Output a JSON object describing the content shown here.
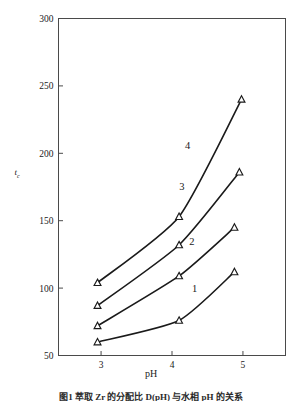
{
  "figure": {
    "caption": "图1  萃取 Zr 的分配比 D(pH) 与水相 pH 的关系"
  },
  "chart_data": {
    "type": "line",
    "title": "",
    "xlabel": "pH",
    "ylabel": "t_c",
    "ylabel_main": "t",
    "ylabel_sub": "c",
    "xlim": [
      2.4,
      5.6
    ],
    "ylim": [
      50,
      300
    ],
    "xticks": [
      3,
      4,
      5
    ],
    "xticklabels": [
      "3",
      "4",
      "5"
    ],
    "yticks": [
      50,
      100,
      150,
      200,
      250,
      300
    ],
    "yticklabels": [
      "50",
      "100",
      "150",
      "200",
      "250",
      "300"
    ],
    "grid": false,
    "legend": "inline-curve-numbers",
    "marker": "open-triangle",
    "line_color": "#1a1a1a",
    "series": [
      {
        "name": "1",
        "label": "1",
        "label_x": 4.32,
        "label_y": 97,
        "x": [
          2.95,
          4.1,
          4.88
        ],
        "y": [
          60,
          76,
          112
        ]
      },
      {
        "name": "2",
        "label": "2",
        "label_x": 4.28,
        "label_y": 132,
        "x": [
          2.95,
          4.1,
          4.88
        ],
        "y": [
          72,
          109,
          145
        ]
      },
      {
        "name": "3",
        "label": "3",
        "label_x": 4.14,
        "label_y": 173,
        "x": [
          2.95,
          4.1,
          4.95
        ],
        "y": [
          87,
          132,
          186
        ]
      },
      {
        "name": "4",
        "label": "4",
        "label_x": 4.22,
        "label_y": 203,
        "x": [
          2.95,
          4.1,
          4.98
        ],
        "y": [
          104,
          153,
          240
        ]
      }
    ]
  }
}
